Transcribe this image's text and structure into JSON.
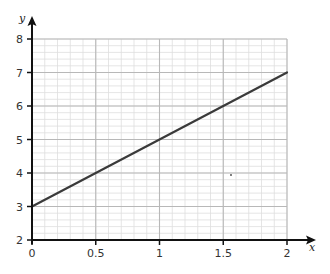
{
  "chart_data": {
    "type": "line",
    "title": "",
    "xlabel": "x",
    "ylabel": "y",
    "xlim": [
      0,
      2
    ],
    "ylim": [
      2,
      8
    ],
    "x_ticks": [
      0,
      0.5,
      1,
      1.5,
      2
    ],
    "x_tick_labels": [
      "0",
      "0.5",
      "1",
      "1.5",
      "2"
    ],
    "y_ticks": [
      2,
      3,
      4,
      5,
      6,
      7,
      8
    ],
    "y_tick_labels": [
      "2",
      "3",
      "4",
      "5",
      "6",
      "7",
      "8"
    ],
    "grid": true,
    "minor_grid": {
      "x_step": 0.1,
      "y_step": 0.2
    },
    "series": [
      {
        "name": "y = 2x + 3",
        "x": [
          0,
          0.5,
          1,
          1.5,
          2
        ],
        "y": [
          3,
          4,
          5,
          6,
          7
        ]
      }
    ],
    "colors": {
      "line": "#3a3a3a",
      "axis": "#111111",
      "major_grid": "#b8b8b8",
      "minor_grid": "#dedede"
    }
  }
}
